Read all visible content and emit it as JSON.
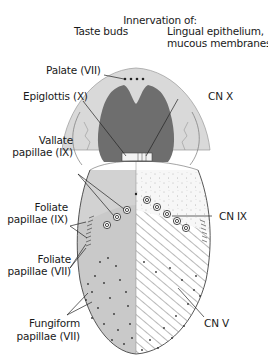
{
  "header": {
    "title": "Innervation of:",
    "col_left": "Taste buds",
    "col_right_line1": "Lingual epithelium,",
    "col_right_line2": "mucous membranes"
  },
  "labels_left": {
    "palate": "Palate (VII)",
    "epiglottis": "Epiglottis (X)",
    "vallate_1": "Vallate",
    "vallate_2": "papillae (IX)",
    "foliate_ix_1": "Foliate",
    "foliate_ix_2": "papillae (IX)",
    "foliate_vii_1": "Foliate",
    "foliate_vii_2": "papillae (VII)",
    "fungiform_1": "Fungiform",
    "fungiform_2": "papillae (VII)"
  },
  "labels_right": {
    "cn_x": "CN X",
    "cn_ix": "CN IX",
    "cn_v": "CN V"
  },
  "colors": {
    "outer_gray": "#d4d4d4",
    "pharynx_dark": "#6e6e6e",
    "taste_bud_region": "#c8c8c8",
    "line": "#222222"
  }
}
